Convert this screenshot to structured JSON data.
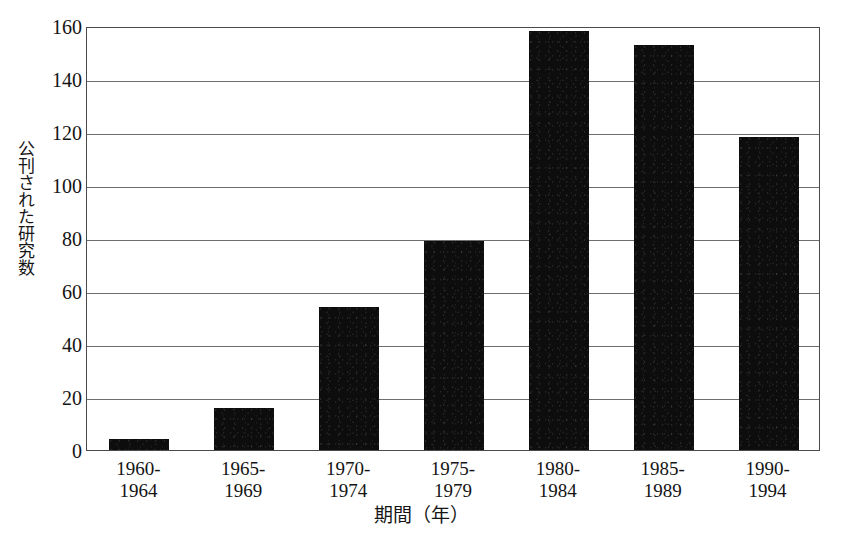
{
  "chart_data": {
    "type": "bar",
    "title": "",
    "xlabel": "期間（年）",
    "ylabel": "公刊された研究数",
    "categories": [
      "1960-1964",
      "1965-1969",
      "1970-1974",
      "1975-1979",
      "1980-1984",
      "1985-1989",
      "1990-1994"
    ],
    "category_lines": [
      [
        "1960-",
        "1964"
      ],
      [
        "1965-",
        "1969"
      ],
      [
        "1970-",
        "1974"
      ],
      [
        "1975-",
        "1979"
      ],
      [
        "1980-",
        "1984"
      ],
      [
        "1985-",
        "1989"
      ],
      [
        "1990-",
        "1994"
      ]
    ],
    "values": [
      4,
      16,
      54,
      79,
      158,
      153,
      118
    ],
    "ylim": [
      0,
      160
    ],
    "ytick_values": [
      0,
      20,
      40,
      60,
      80,
      100,
      120,
      140,
      160
    ],
    "ytick_labels": [
      "0",
      "20",
      "40",
      "60",
      "80",
      "100",
      "120",
      "140",
      "160"
    ],
    "grid": true,
    "legend": false,
    "bar_color": "#0d0d0d",
    "frame_color": "#4a4a4a",
    "grid_color": "#6e6e6e",
    "background": "#ffffff"
  }
}
